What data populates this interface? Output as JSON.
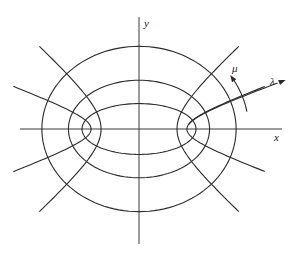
{
  "figure": {
    "axes": {
      "x_label": "x",
      "y_label": "y"
    },
    "coordinate_labels": {
      "lambda": "λ",
      "mu": "μ"
    },
    "geometry": {
      "center": [
        139,
        129
      ],
      "focal_distance_px": 51,
      "ellipse_lambda_values": [
        0.48,
        0.85,
        1.26
      ],
      "hyperbola_mu_values": [
        0.35,
        0.73,
        2.41,
        2.79
      ],
      "hyperbola_lambda_max": 1.62,
      "x_axis": {
        "from": 20,
        "to": 282,
        "y": 129
      },
      "y_axis": {
        "x": 139,
        "from": 17,
        "to": 244
      }
    },
    "colors": {
      "line": "#2a2a2a",
      "background": "#ffffff"
    }
  }
}
